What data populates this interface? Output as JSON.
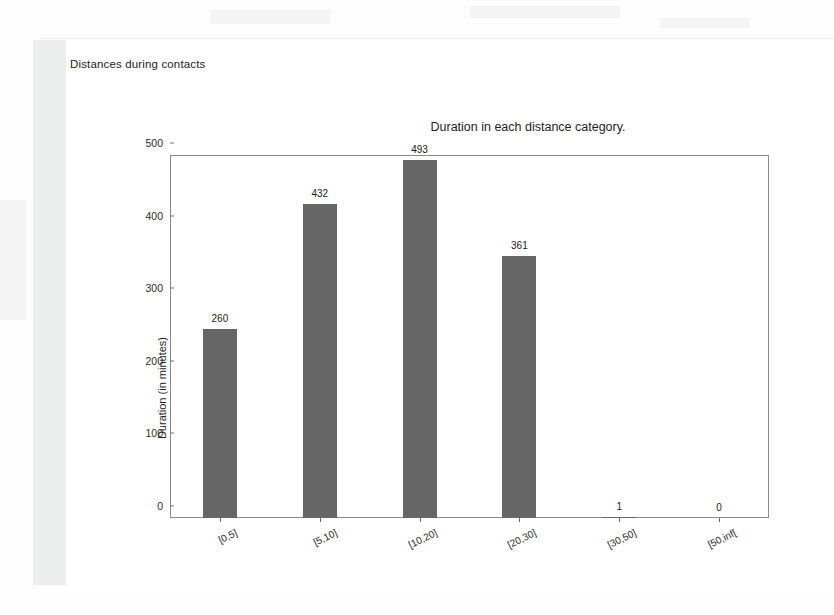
{
  "document": {
    "heading": "Distances during contacts"
  },
  "chart_data": {
    "type": "bar",
    "title": "Duration in each distance category.",
    "xlabel": "",
    "ylabel": "Duration (in minutes)",
    "categories": [
      "[0,5]",
      "[5,10]",
      "[10,20]",
      "[20,30]",
      "[30,50]",
      "[50,inf["
    ],
    "values": [
      260,
      432,
      493,
      361,
      1,
      0
    ],
    "value_labels": [
      "260",
      "432",
      "493",
      "361",
      "1",
      "0"
    ],
    "ylim": [
      0,
      500
    ],
    "yticks": [
      0,
      100,
      200,
      300,
      400,
      500
    ],
    "ytick_labels": [
      "0",
      "100",
      "200",
      "300",
      "400",
      "500"
    ],
    "grid": false,
    "legend": null,
    "bar_color": "#666666",
    "axis_color": "#8a8a8a"
  }
}
